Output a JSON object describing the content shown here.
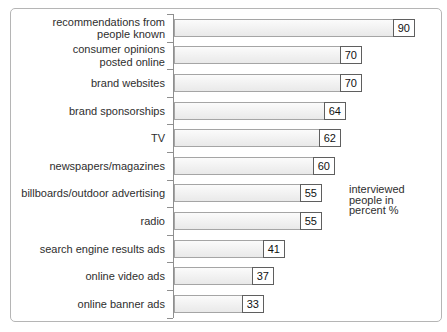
{
  "chart_data": {
    "type": "bar",
    "orientation": "horizontal",
    "title": "",
    "categories": [
      "recommendations from\npeople known",
      "consumer opinions\nposted online",
      "brand websites",
      "brand sponsorships",
      "TV",
      "newspapers/magazines",
      "billboards/outdoor advertising",
      "radio",
      "search engine results ads",
      "online video ads",
      "online banner ads"
    ],
    "values": [
      90,
      70,
      70,
      64,
      62,
      60,
      55,
      55,
      41,
      37,
      33
    ],
    "xlim": [
      0,
      95
    ],
    "value_labels_position": "boxed at bar end",
    "annotation": "interviewed\npeople in\npercent %",
    "legend": "none",
    "grid": false
  },
  "colors": {
    "background": "#ffffff",
    "panel-border": "#b5b5b5",
    "axis": "#8f8f8f",
    "bar-border": "#a5a5a5",
    "value-box-border": "#5f5f5f",
    "text": "#2e2e2e"
  }
}
